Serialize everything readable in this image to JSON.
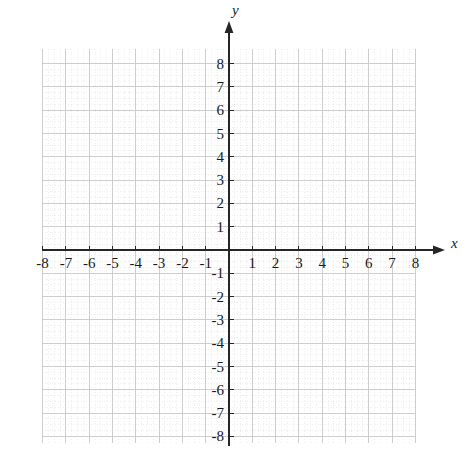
{
  "figure": {
    "kind": "cartesian-coordinate-plane",
    "background_color": "#ffffff",
    "axis_color": "#262626",
    "major_grid_color": "#c9c9c9",
    "minor_grid_color": "#e2e2e2",
    "label_color": "#1a1a1a"
  },
  "axes": {
    "x_axis_name": "x",
    "y_axis_name": "y",
    "x_arrow": "arrow-right",
    "y_arrow": "arrow-up"
  },
  "chart_data": {
    "type": "scatter",
    "title": "",
    "subtitle": "",
    "xlabel": "x",
    "ylabel": "y",
    "xlim": [
      -8,
      8
    ],
    "ylim": [
      -8,
      8
    ],
    "x_major_step": 1,
    "y_major_step": 1,
    "minor_subdivisions": 4,
    "grid": true,
    "legend": null,
    "legend_position": "none",
    "annotations": [],
    "series": [],
    "x_tick_labels": [
      "-8",
      "-7",
      "-6",
      "-5",
      "-4",
      "-3",
      "-2",
      "-1",
      "1",
      "2",
      "3",
      "4",
      "5",
      "6",
      "7",
      "8"
    ],
    "x_tick_values": [
      -8,
      -7,
      -6,
      -5,
      -4,
      -3,
      -2,
      -1,
      1,
      2,
      3,
      4,
      5,
      6,
      7,
      8
    ],
    "y_tick_labels": [
      "8",
      "7",
      "6",
      "5",
      "4",
      "3",
      "2",
      "1",
      "-1",
      "-2",
      "-3",
      "-4",
      "-5",
      "-6",
      "-7",
      "-8"
    ],
    "y_tick_values": [
      8,
      7,
      6,
      5,
      4,
      3,
      2,
      1,
      -1,
      -2,
      -3,
      -4,
      -5,
      -6,
      -7,
      -8
    ],
    "origin_label": ""
  },
  "geometry": {
    "origin_px": {
      "x": 229,
      "y": 250
    },
    "unit_px": 23.3,
    "grid_left_px": 42,
    "grid_right_px": 415,
    "grid_top_px": 49,
    "grid_bottom_px": 443
  }
}
